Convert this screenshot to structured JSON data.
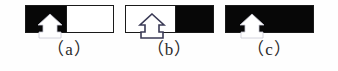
{
  "figure": {
    "background_color": "#fefefe",
    "panel_count": 3,
    "panel_border_color": "#1a1a1a",
    "black_color": "#070707",
    "white_color": "#ffffff",
    "marker_icon": "pawn-arrow-marker",
    "panels": [
      {
        "id": "a",
        "caption": "（a）",
        "left_half_color": "#070707",
        "right_half_color": "#ffffff",
        "split_fraction": 0.46,
        "marker_style": "white-filled",
        "marker_center_fraction": 0.28,
        "description": "left half black, right half white"
      },
      {
        "id": "b",
        "caption": "（b）",
        "left_half_color": "#ffffff",
        "right_half_color": "#070707",
        "split_fraction": 0.56,
        "marker_style": "outlined",
        "marker_center_fraction": 0.3,
        "description": "left half white, right half black"
      },
      {
        "id": "c",
        "caption": "（c）",
        "left_half_color": "#070707",
        "right_half_color": "#070707",
        "split_fraction": 1.0,
        "marker_style": "white-filled",
        "marker_center_fraction": 0.3,
        "description": "fully black panel"
      }
    ]
  }
}
